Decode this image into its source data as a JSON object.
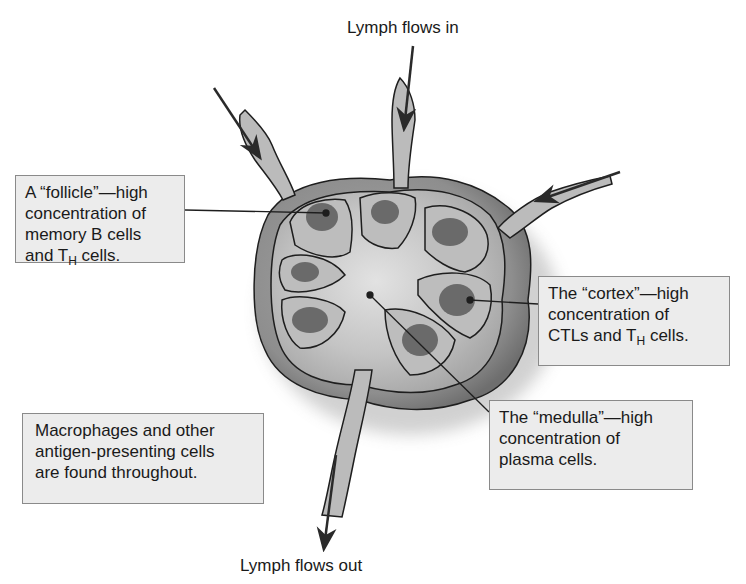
{
  "labels": {
    "lymph_in": "Lymph flows in",
    "lymph_out": "Lymph flows out"
  },
  "callouts": {
    "follicle": {
      "line1": "A “follicle”—high",
      "line2": "concentration of",
      "line3": "memory B cells",
      "line4_pre": "and T",
      "line4_sub": "H",
      "line4_post": " cells."
    },
    "cortex": {
      "line1": "The “cortex”—high",
      "line2": "concentration of",
      "line3_pre": "CTLs and T",
      "line3_sub": "H",
      "line3_post": " cells."
    },
    "medulla": {
      "line1": "The “medulla”—high",
      "line2": "concentration of",
      "line3": "plasma cells."
    },
    "macrophages": {
      "line1": "Macrophages and other",
      "line2": "antigen-presenting cells",
      "line3": "are found throughout."
    }
  },
  "colors": {
    "capsule": "#8c8c8c",
    "cortex_tissue": "#b8b8b8",
    "follicle": "#6a6a6a",
    "medulla": "#d8d8d8",
    "outline": "#1e1e1e",
    "box_fill": "#ececec",
    "box_border": "#8a8a8a"
  }
}
